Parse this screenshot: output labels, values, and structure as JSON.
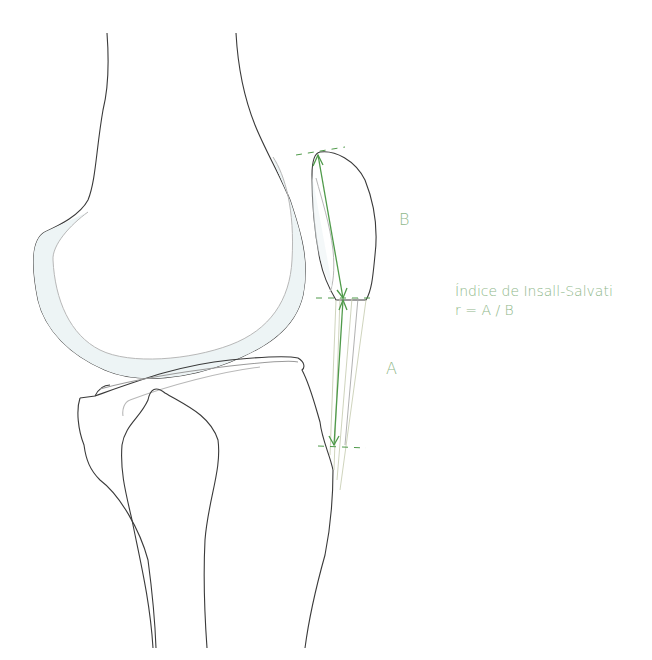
{
  "diagram": {
    "labels": {
      "segment_b": "B",
      "segment_a": "A"
    },
    "title": "Índice de Insall-Salvati",
    "formula": "r = A / B",
    "colors": {
      "bone_outline": "#3a3a3a",
      "cartilage_fill": "#edf4f5",
      "cartilage_line": "#b8b8b8",
      "measure_green": "#4f9a4a",
      "label_green": "#8fb88a",
      "tendon_line": "#c9cfb5"
    }
  }
}
